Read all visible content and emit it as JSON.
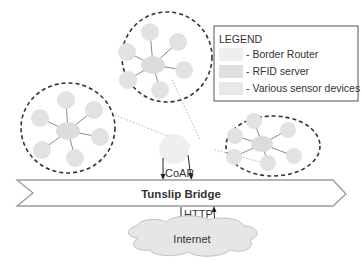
{
  "diagram": {
    "legend": {
      "title": "LEGEND",
      "items": [
        {
          "label": "- Border Router",
          "color": "#efefef"
        },
        {
          "label": "- RFID server",
          "color": "#e0e0e0"
        },
        {
          "label": "- Various sensor devices",
          "color": "#e8e8e8"
        }
      ]
    },
    "bridge": {
      "label": "Tunslip Bridge"
    },
    "protocols": {
      "upper": "CoAP",
      "lower": "HTTP"
    },
    "cloud": {
      "label": "Internet"
    },
    "clusters": [
      {
        "name": "top-cluster",
        "nodes": 6
      },
      {
        "name": "left-cluster",
        "nodes": 6
      },
      {
        "name": "right-cluster",
        "nodes": 6
      }
    ],
    "colors": {
      "node_fill": "#e2e2e2",
      "cluster_border": "#333333",
      "bridge_stroke": "#999999",
      "cloud_fill": "#e6e6e6"
    }
  }
}
